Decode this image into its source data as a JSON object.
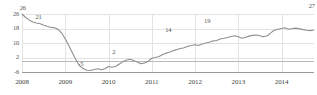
{
  "chart_data": {
    "type": "line",
    "title": "",
    "subtitle": "",
    "xlabel": "",
    "ylabel": "",
    "grid": true,
    "legend": "none",
    "line_color": "#8f8f8f",
    "grid_color": "#e3e3e3",
    "axis_color": "#9a9a9a",
    "text_color": "#555555",
    "ylim": [
      -6,
      26
    ],
    "yticks": [
      26,
      18,
      10,
      2,
      -6
    ],
    "ytick_labels": [
      "26",
      "18",
      "10",
      "2",
      "-6"
    ],
    "xlim": [
      2008.0,
      2014.75
    ],
    "xticks": [
      2008,
      2009,
      2010,
      2011,
      2012,
      2013,
      2014
    ],
    "xtick_labels": [
      "2008",
      "2009",
      "2010",
      "2011",
      "2012",
      "2013",
      "2014"
    ],
    "annotations": [
      {
        "label": "26",
        "x": 2008.02,
        "y": 26
      },
      {
        "label": "21",
        "x": 2008.38,
        "y": 21
      },
      {
        "label": "-5",
        "x": 2009.36,
        "y": -5
      },
      {
        "label": "2",
        "x": 2010.12,
        "y": 2
      },
      {
        "label": "14",
        "x": 2011.38,
        "y": 14
      },
      {
        "label": "19",
        "x": 2012.28,
        "y": 19
      },
      {
        "label": "27",
        "x": 2014.7,
        "y": 27
      }
    ],
    "x": [
      2008.0,
      2008.08,
      2008.17,
      2008.25,
      2008.33,
      2008.42,
      2008.5,
      2008.58,
      2008.67,
      2008.75,
      2008.83,
      2008.92,
      2009.0,
      2009.08,
      2009.17,
      2009.25,
      2009.33,
      2009.42,
      2009.5,
      2009.58,
      2009.67,
      2009.75,
      2009.83,
      2009.92,
      2010.0,
      2010.08,
      2010.17,
      2010.25,
      2010.33,
      2010.42,
      2010.5,
      2010.58,
      2010.67,
      2010.75,
      2010.83,
      2010.92,
      2011.0,
      2011.08,
      2011.17,
      2011.25,
      2011.33,
      2011.42,
      2011.5,
      2011.58,
      2011.67,
      2011.75,
      2011.83,
      2011.92,
      2012.0,
      2012.08,
      2012.17,
      2012.25,
      2012.33,
      2012.42,
      2012.5,
      2012.58,
      2012.67,
      2012.75,
      2012.83,
      2012.92,
      2013.0,
      2013.08,
      2013.17,
      2013.25,
      2013.33,
      2013.42,
      2013.5,
      2013.58,
      2013.67,
      2013.75,
      2013.83,
      2013.92,
      2014.0,
      2014.08,
      2014.17,
      2014.25,
      2014.33,
      2014.42,
      2014.5,
      2014.58,
      2014.67,
      2014.75
    ],
    "values": [
      26.0,
      24.2,
      22.6,
      21.6,
      21.0,
      20.6,
      19.8,
      19.2,
      18.6,
      18.4,
      17.6,
      15.4,
      12.2,
      8.6,
      4.4,
      0.6,
      -2.6,
      -4.2,
      -5.0,
      -5.2,
      -4.6,
      -4.2,
      -4.8,
      -4.2,
      -3.0,
      -3.4,
      -2.8,
      -1.6,
      -0.4,
      0.6,
      1.0,
      0.4,
      -0.6,
      -1.4,
      -1.0,
      0.0,
      1.6,
      2.0,
      2.6,
      3.6,
      4.4,
      5.0,
      5.8,
      6.4,
      7.0,
      7.4,
      8.2,
      8.6,
      9.0,
      8.6,
      9.4,
      10.0,
      10.4,
      11.2,
      11.4,
      12.2,
      12.6,
      13.0,
      13.6,
      14.0,
      13.4,
      12.6,
      13.2,
      13.8,
      14.2,
      14.4,
      14.0,
      13.4,
      14.0,
      15.6,
      17.0,
      17.6,
      18.0,
      18.4,
      17.6,
      18.0,
      18.2,
      17.8,
      17.4,
      17.0,
      16.8,
      17.2
    ],
    "values_extra": {
      "note_segments": [
        {
          "name": "2013-2014 plateau",
          "start_x": 2013.0,
          "end_x": 2014.3
        },
        {
          "name": "final-rise",
          "start_x": 2014.3,
          "end_x": 2014.75
        }
      ]
    }
  }
}
